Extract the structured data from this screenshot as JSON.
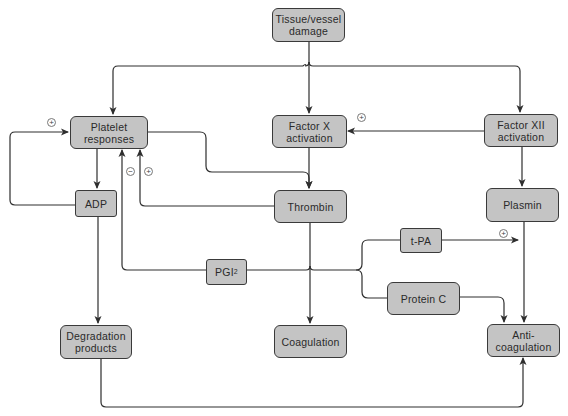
{
  "diagram": {
    "nodes": {
      "tissue_damage": "Tissue/vessel\ndamage",
      "platelet_responses": "Platelet\nresponses",
      "factor_x": "Factor X\nactivation",
      "factor_xii": "Factor XII\nactivation",
      "adp": "ADP",
      "thrombin": "Thrombin",
      "plasmin": "Plasmin",
      "tpa": "t-PA",
      "pgi2_base": "PGI",
      "pgi2_sub": "2",
      "protein_c": "Protein C",
      "degradation_products": "Degradation\nproducts",
      "coagulation": "Coagulation",
      "anticoagulation": "Anti-\ncoagulation"
    },
    "signs": {
      "adp_to_platelet": "+",
      "pgi2_to_platelet": "−",
      "thrombin_to_platelet": "+",
      "factor_xii_to_factor_x": "+",
      "tpa_to_plasmin_path": "+"
    },
    "edges": [
      {
        "from": "Tissue/vessel damage",
        "to": "Platelet responses"
      },
      {
        "from": "Tissue/vessel damage",
        "to": "Factor X activation"
      },
      {
        "from": "Tissue/vessel damage",
        "to": "Factor XII activation"
      },
      {
        "from": "Factor XII activation",
        "to": "Factor X activation",
        "sign": "+"
      },
      {
        "from": "Factor XII activation",
        "to": "Plasmin"
      },
      {
        "from": "Platelet responses",
        "to": "ADP"
      },
      {
        "from": "Platelet responses",
        "to": "Thrombin"
      },
      {
        "from": "Factor X activation",
        "to": "Thrombin"
      },
      {
        "from": "ADP",
        "to": "Platelet responses",
        "sign": "+"
      },
      {
        "from": "Thrombin",
        "to": "Platelet responses",
        "sign": "+"
      },
      {
        "from": "PGI2",
        "to": "Platelet responses",
        "sign": "−"
      },
      {
        "from": "ADP",
        "to": "Degradation products"
      },
      {
        "from": "Thrombin",
        "to": "Coagulation"
      },
      {
        "from": "Thrombin",
        "to": "PGI2"
      },
      {
        "from": "Thrombin",
        "to": "t-PA"
      },
      {
        "from": "Thrombin",
        "to": "Protein C"
      },
      {
        "from": "t-PA",
        "to": "Plasmin path",
        "sign": "+"
      },
      {
        "from": "Protein C",
        "to": "Anti-coagulation"
      },
      {
        "from": "Plasmin",
        "to": "Anti-coagulation"
      },
      {
        "from": "Degradation products",
        "to": "Anti-coagulation"
      }
    ],
    "colors": {
      "node_fill": "#c4c4c4",
      "node_border": "#3a3a3a",
      "line": "#2e2e2e",
      "background": "#ffffff"
    }
  }
}
